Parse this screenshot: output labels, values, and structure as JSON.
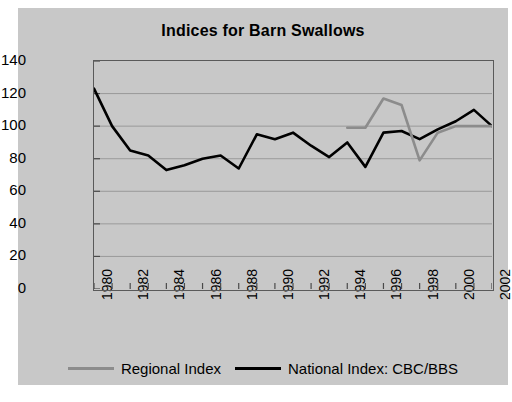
{
  "chart_data": {
    "type": "line",
    "title": "Indices for Barn Swallows",
    "xlabel": "",
    "ylabel": "Index: 2002=100",
    "xlim": [
      1980,
      2002
    ],
    "ylim": [
      0,
      140
    ],
    "ytick_step": 20,
    "yticks": [
      "0",
      "20",
      "40",
      "60",
      "80",
      "100",
      "120",
      "140"
    ],
    "xticks": [
      "1980",
      "1982",
      "1984",
      "1986",
      "1988",
      "1990",
      "1992",
      "1994",
      "1996",
      "1998",
      "2000",
      "2002"
    ],
    "x": [
      1980,
      1981,
      1982,
      1983,
      1984,
      1985,
      1986,
      1987,
      1988,
      1989,
      1990,
      1991,
      1992,
      1993,
      1994,
      1995,
      1996,
      1997,
      1998,
      1999,
      2000,
      2001,
      2002
    ],
    "grid": true,
    "legend_position": "bottom",
    "series": [
      {
        "name": "Regional Index",
        "color": "#8c8c8c",
        "x": [
          1994,
          1995,
          1996,
          1997,
          1998,
          1999,
          2000,
          2001,
          2002
        ],
        "values": [
          99,
          99,
          117,
          113,
          79,
          96,
          100,
          100,
          100
        ]
      },
      {
        "name": "National Index: CBC/BBS",
        "color": "#000000",
        "x": [
          1980,
          1981,
          1982,
          1983,
          1984,
          1985,
          1986,
          1987,
          1988,
          1989,
          1990,
          1991,
          1992,
          1993,
          1994,
          1995,
          1996,
          1997,
          1998,
          1999,
          2000,
          2001,
          2002
        ],
        "values": [
          123,
          100,
          85,
          82,
          73,
          76,
          80,
          82,
          74,
          95,
          92,
          96,
          88,
          81,
          90,
          75,
          96,
          97,
          92,
          98,
          103,
          110,
          100
        ]
      }
    ]
  }
}
